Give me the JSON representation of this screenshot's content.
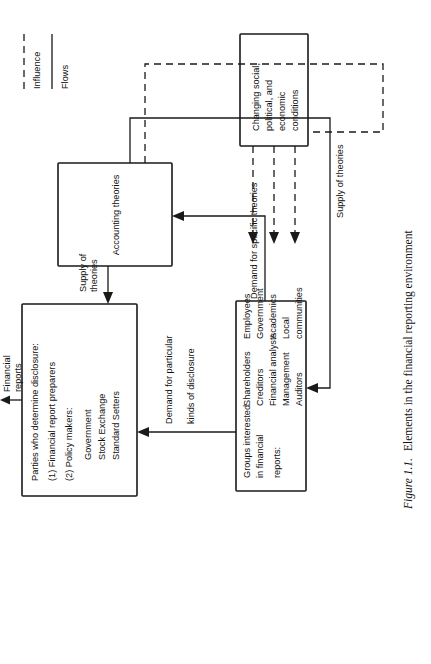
{
  "figure": {
    "caption_label": "Figure 1.1.",
    "caption_text": "Elements in the financial reporting environment"
  },
  "nodes": {
    "parties": {
      "name": "parties-who-determine-disclosure",
      "lines": [
        "Parties who determine disclosure:",
        "(1)  Financial report preparers",
        "(2)  Policy makers:",
        "Government",
        "Stock Exchange",
        "Standard Setters"
      ],
      "l0": "Parties who determine disclosure:",
      "l1": "(1)  Financial report preparers",
      "l2": "(2)  Policy makers:",
      "l3": "Government",
      "l4": "Stock Exchange",
      "l5": "Standard Setters"
    },
    "groups": {
      "name": "groups-interested-in-financial-reports",
      "lines": [
        "Groups interested",
        "in financial",
        "reports:",
        "Shareholders",
        "Creditors",
        "Financial analysts",
        "Management",
        "Auditors",
        "Employees",
        "Government",
        "Academics",
        "Local",
        "communities"
      ],
      "l0": "Groups interested",
      "l1": "in financial",
      "l2": "reports:",
      "l3": "Shareholders",
      "l4": "Creditors",
      "l5": "Financial analysts",
      "l6": "Management",
      "l7": "Auditors",
      "l8": "Employees",
      "l9": "Government",
      "l10": "Academics",
      "l11": "Local",
      "l12": "communities"
    },
    "theories": {
      "name": "accounting-theories",
      "label": "Accounting theories"
    },
    "conditions": {
      "name": "changing-conditions",
      "lines": [
        "Changing social,",
        "political, and",
        "economic",
        "conditions"
      ],
      "l0": "Changing social,",
      "l1": "political, and",
      "l2": "economic",
      "l3": "conditions"
    }
  },
  "edges": {
    "financial_reports": {
      "l0": "Financial",
      "l1": "reports"
    },
    "demand_disclosure": {
      "l0": "Demand for particular",
      "l1": "kinds of disclosure"
    },
    "supply_theories_top": {
      "l0": "Supply of",
      "l1": "theories"
    },
    "demand_specific": {
      "l0": "Demand for specific theories"
    },
    "supply_theories_long": {
      "l0": "Supply of theories"
    }
  },
  "legend": {
    "influence": "Influence",
    "flows": "Flows"
  },
  "colors": {
    "ink": "#1a1a1a",
    "paper": "#ffffff"
  }
}
